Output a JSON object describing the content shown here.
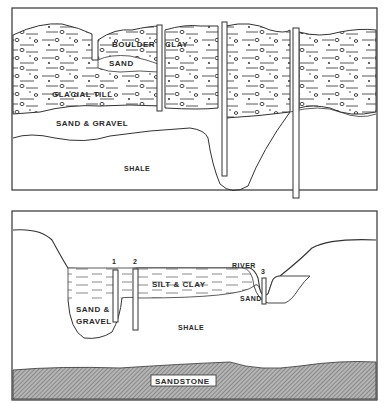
{
  "top_panel": {
    "labels": {
      "boulder": "BOULDER",
      "clay": "CLAY",
      "sand": "SAND",
      "glacial_till": "GLACIAL TILL",
      "sand_gravel": "SAND & GRAVEL",
      "shale": "SHALE"
    }
  },
  "bottom_panel": {
    "labels": {
      "well_1": "1",
      "well_2": "2",
      "well_3": "3",
      "river": "RIVER",
      "silt_clay": "SILT & CLAY",
      "sand_gravel_line1": "SAND &",
      "sand_gravel_line2": "GRAVEL",
      "sand": "SAND",
      "shale": "SHALE",
      "sandstone": "SANDSTONE"
    }
  },
  "colors": {
    "ink": "#2a2a2a",
    "paper": "#ffffff",
    "hatch": "#8a8a8a"
  }
}
